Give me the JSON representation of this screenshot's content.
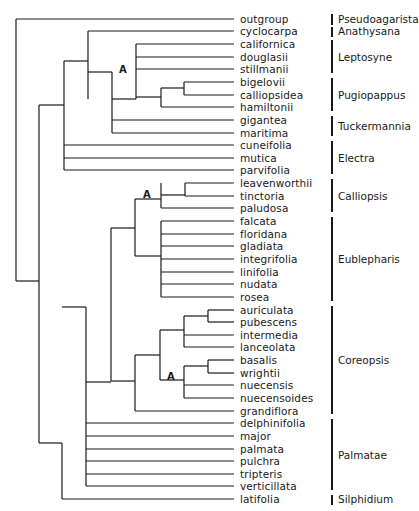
{
  "leaves": [
    {
      "name": "outgroup",
      "y": 19
    },
    {
      "name": "cyclocarpa",
      "y": 31
    },
    {
      "name": "californica",
      "y": 44
    },
    {
      "name": "douglasii",
      "y": 57
    },
    {
      "name": "stillmanii",
      "y": 69
    },
    {
      "name": "bigelovii",
      "y": 82
    },
    {
      "name": "calliopsidea",
      "y": 95
    },
    {
      "name": "hamiltonii",
      "y": 107
    },
    {
      "name": "gigantea",
      "y": 120
    },
    {
      "name": "maritima",
      "y": 133
    },
    {
      "name": "cuneifolia",
      "y": 145
    },
    {
      "name": "mutica",
      "y": 158
    },
    {
      "name": "parvifolia",
      "y": 170
    },
    {
      "name": "leavenworthii",
      "y": 183
    },
    {
      "name": "tinctoria",
      "y": 196
    },
    {
      "name": "paludosa",
      "y": 208
    },
    {
      "name": "falcata",
      "y": 221
    },
    {
      "name": "floridana",
      "y": 234
    },
    {
      "name": "gladiata",
      "y": 246
    },
    {
      "name": "integrifolia",
      "y": 259
    },
    {
      "name": "linifolia",
      "y": 272
    },
    {
      "name": "nudata",
      "y": 284
    },
    {
      "name": "rosea",
      "y": 297
    },
    {
      "name": "auriculata",
      "y": 310
    },
    {
      "name": "pubescens",
      "y": 322
    },
    {
      "name": "intermedia",
      "y": 335
    },
    {
      "name": "lanceolata",
      "y": 347
    },
    {
      "name": "basalis",
      "y": 360
    },
    {
      "name": "wrightii",
      "y": 373
    },
    {
      "name": "nuecensis",
      "y": 385
    },
    {
      "name": "nuecensoides",
      "y": 398
    },
    {
      "name": "grandiflora",
      "y": 411
    },
    {
      "name": "delphinifolia",
      "y": 423
    },
    {
      "name": "major",
      "y": 436
    },
    {
      "name": "palmata",
      "y": 449
    },
    {
      "name": "pulchra",
      "y": 461
    },
    {
      "name": "tripteris",
      "y": 474
    },
    {
      "name": "verticillata",
      "y": 486
    },
    {
      "name": "latifolia",
      "y": 499
    }
  ],
  "groups": [
    {
      "name": "Pseudoagarista",
      "top": 14,
      "bottom": 25,
      "label_y": 19
    },
    {
      "name": "Anathysana",
      "top": 27,
      "bottom": 37,
      "label_y": 31
    },
    {
      "name": "Leptosyne",
      "top": 40,
      "bottom": 73,
      "label_y": 57
    },
    {
      "name": "Pugiopappus",
      "top": 78,
      "bottom": 111,
      "label_y": 95
    },
    {
      "name": "Tuckermannia",
      "top": 116,
      "bottom": 136,
      "label_y": 126
    },
    {
      "name": "Electra",
      "top": 141,
      "bottom": 174,
      "label_y": 158
    },
    {
      "name": "Calliopsis",
      "top": 179,
      "bottom": 212,
      "label_y": 196
    },
    {
      "name": "Eublepharis",
      "top": 217,
      "bottom": 301,
      "label_y": 259
    },
    {
      "name": "Coreopsis",
      "top": 306,
      "bottom": 414,
      "label_y": 360
    },
    {
      "name": "Palmatae",
      "top": 419,
      "bottom": 490,
      "label_y": 455
    },
    {
      "name": "Silphidium",
      "top": 495,
      "bottom": 505,
      "label_y": 499
    }
  ],
  "node_markers": [
    {
      "label": "A",
      "x": 119,
      "y": 65
    },
    {
      "label": "A",
      "x": 143,
      "y": 190
    },
    {
      "label": "A",
      "x": 167,
      "y": 372
    }
  ],
  "tree_lines": {
    "leaf_end_x": 234,
    "horizontal": [
      [
        16,
        19,
        234
      ],
      [
        88,
        31,
        234
      ],
      [
        136,
        44,
        234
      ],
      [
        136,
        57,
        234
      ],
      [
        136,
        69,
        234
      ],
      [
        184,
        82,
        234
      ],
      [
        184,
        95,
        234
      ],
      [
        161,
        107,
        234
      ],
      [
        112,
        120,
        234
      ],
      [
        112,
        133,
        234
      ],
      [
        64,
        145,
        234
      ],
      [
        64,
        158,
        234
      ],
      [
        64,
        170,
        234
      ],
      [
        185,
        183,
        234
      ],
      [
        185,
        196,
        234
      ],
      [
        161,
        208,
        234
      ],
      [
        161,
        221,
        234
      ],
      [
        161,
        234,
        234
      ],
      [
        161,
        246,
        234
      ],
      [
        161,
        259,
        234
      ],
      [
        161,
        272,
        234
      ],
      [
        161,
        284,
        234
      ],
      [
        161,
        297,
        234
      ],
      [
        208,
        310,
        234
      ],
      [
        208,
        322,
        234
      ],
      [
        184,
        335,
        234
      ],
      [
        184,
        347,
        234
      ],
      [
        208,
        360,
        234
      ],
      [
        208,
        373,
        234
      ],
      [
        184,
        385,
        234
      ],
      [
        184,
        398,
        234
      ],
      [
        135,
        411,
        234
      ],
      [
        86,
        423,
        234
      ],
      [
        86,
        436,
        234
      ],
      [
        86,
        449,
        234
      ],
      [
        86,
        461,
        234
      ],
      [
        86,
        474,
        234
      ],
      [
        86,
        486,
        234
      ],
      [
        62,
        499,
        234
      ],
      [
        16,
        281,
        39
      ],
      [
        39,
        105,
        64
      ],
      [
        64,
        61,
        88
      ],
      [
        88,
        72,
        112
      ],
      [
        112,
        99,
        136
      ],
      [
        136,
        97,
        161
      ],
      [
        161,
        88,
        184
      ],
      [
        39,
        443,
        62
      ],
      [
        62,
        307,
        86
      ],
      [
        86,
        382,
        111
      ],
      [
        111,
        228,
        135
      ],
      [
        135,
        199,
        161
      ],
      [
        161,
        195,
        185
      ],
      [
        135,
        256,
        161
      ],
      [
        111,
        381,
        135
      ],
      [
        135,
        355,
        160
      ],
      [
        160,
        330,
        184
      ],
      [
        184,
        316,
        208
      ],
      [
        160,
        380,
        184
      ],
      [
        184,
        366,
        208
      ]
    ],
    "vertical": [
      [
        16,
        19,
        281
      ],
      [
        39,
        105,
        443
      ],
      [
        64,
        61,
        170
      ],
      [
        88,
        31,
        99
      ],
      [
        112,
        72,
        133
      ],
      [
        136,
        44,
        99
      ],
      [
        161,
        88,
        107
      ],
      [
        184,
        82,
        95
      ],
      [
        62,
        443,
        499
      ],
      [
        86,
        307,
        486
      ],
      [
        111,
        228,
        381
      ],
      [
        135,
        199,
        256
      ],
      [
        161,
        183,
        208
      ],
      [
        185,
        183,
        196
      ],
      [
        161,
        221,
        297
      ],
      [
        135,
        355,
        411
      ],
      [
        160,
        330,
        380
      ],
      [
        184,
        316,
        347
      ],
      [
        208,
        310,
        322
      ],
      [
        184,
        366,
        398
      ],
      [
        208,
        360,
        373
      ]
    ]
  }
}
